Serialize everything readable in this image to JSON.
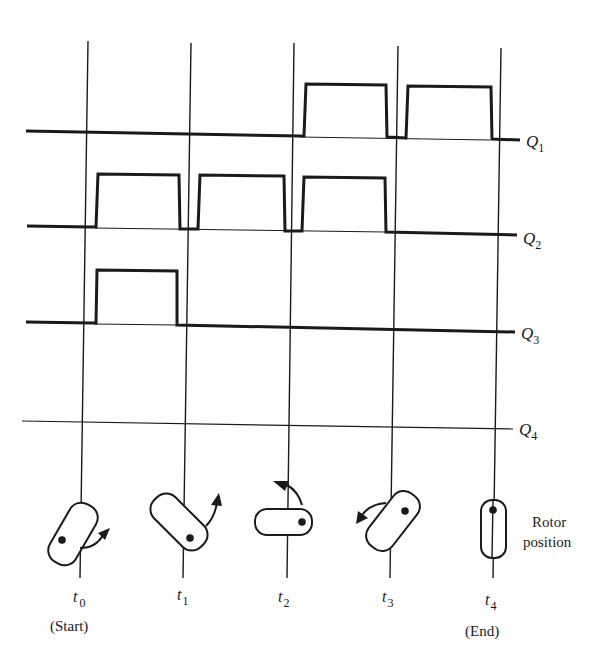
{
  "diagram": {
    "colors": {
      "ink": "#1a1a1a",
      "background": "#ffffff"
    },
    "time_markers": [
      {
        "id": "t0",
        "label": "t",
        "sub": "0",
        "note": "(Start)",
        "x": 88
      },
      {
        "id": "t1",
        "label": "t",
        "sub": "1",
        "note": "",
        "x": 191
      },
      {
        "id": "t2",
        "label": "t",
        "sub": "2",
        "note": "",
        "x": 294
      },
      {
        "id": "t3",
        "label": "t",
        "sub": "3",
        "note": "",
        "x": 398
      },
      {
        "id": "t4",
        "label": "t",
        "sub": "4",
        "note": "(End)",
        "x": 501
      }
    ],
    "signals": [
      {
        "name": "Q",
        "sub": "1",
        "pulses": [
          [
            304,
            387
          ],
          [
            408,
            491
          ]
        ],
        "states": [
          "low",
          "low",
          "high",
          "high"
        ]
      },
      {
        "name": "Q",
        "sub": "2",
        "pulses": [
          [
            97,
            179
          ],
          [
            200,
            284
          ],
          [
            303,
            385
          ]
        ],
        "states": [
          "high",
          "high",
          "high",
          "low"
        ]
      },
      {
        "name": "Q",
        "sub": "3",
        "pulses": [
          [
            96,
            177
          ]
        ],
        "states": [
          "high",
          "low",
          "low",
          "low"
        ]
      },
      {
        "name": "Q",
        "sub": "4",
        "pulses": [],
        "states": [
          "low",
          "low",
          "low",
          "low"
        ]
      }
    ],
    "rotor_label_line1": "Rotor",
    "rotor_label_line2": "position",
    "rotor_positions": [
      {
        "at": "t0",
        "angle_deg": 30,
        "arrow": "clockwise-right"
      },
      {
        "at": "t1",
        "angle_deg": -45,
        "arrow": "up-right"
      },
      {
        "at": "t2",
        "angle_deg": 90,
        "arrow": "up-left"
      },
      {
        "at": "t3",
        "angle_deg": 35,
        "arrow": "left"
      },
      {
        "at": "t4",
        "angle_deg": 0,
        "arrow": "none"
      }
    ]
  }
}
